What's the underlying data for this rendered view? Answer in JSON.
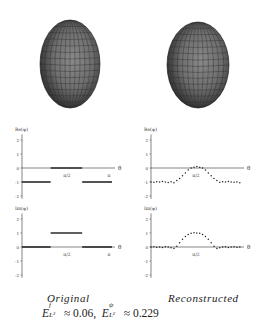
{
  "figure": {
    "captions": {
      "left": "Original",
      "right": "Reconstructed"
    },
    "formula": {
      "term1_symbol": "E",
      "term1_sup": "f",
      "term1_sub": "L²",
      "term1_value": "≈ 0.06,",
      "term2_symbol": "E",
      "term2_sup": "ψ",
      "term2_sub": "L²",
      "term2_value": "≈ 0.229"
    },
    "spheroids": [
      {
        "name": "original-spheroid",
        "cx": 70,
        "cy": 64,
        "rx": 30,
        "ry": 44
      },
      {
        "name": "reconstructed-spheroid",
        "cx": 198,
        "cy": 65,
        "rx": 31,
        "ry": 43
      }
    ]
  },
  "chart_data": [
    {
      "type": "line",
      "title": "Re(ψ) Original",
      "ylabel": "Re(ψ)",
      "xlabel": "θ",
      "x_ticks": [
        "π/2",
        "π"
      ],
      "y_ticks": [
        "2",
        "1",
        "0",
        "-1",
        "-2"
      ],
      "ylim": [
        -2,
        2
      ],
      "xlim": [
        0,
        3.1416
      ],
      "segments": [
        {
          "x": [
            0,
            1.0
          ],
          "y": [
            -1,
            -1
          ]
        },
        {
          "x": [
            1.0,
            2.1
          ],
          "y": [
            0,
            0
          ]
        },
        {
          "x": [
            2.1,
            3.1416
          ],
          "y": [
            -1,
            -1
          ]
        }
      ]
    },
    {
      "type": "scatter",
      "title": "Re(ψ) Reconstructed",
      "ylabel": "Re(ψ)",
      "xlabel": "θ",
      "x_ticks": [
        "π/2"
      ],
      "y_ticks": [
        "2",
        "1",
        "0",
        "-1",
        "-2"
      ],
      "ylim": [
        -2,
        2
      ],
      "x": [
        0.0,
        0.1,
        0.2,
        0.3,
        0.4,
        0.5,
        0.6,
        0.7,
        0.8,
        0.9,
        1.0,
        1.1,
        1.2,
        1.3,
        1.4,
        1.5,
        1.6,
        1.7,
        1.8,
        1.9,
        2.0,
        2.1,
        2.2,
        2.3,
        2.4,
        2.5,
        2.6,
        2.7,
        2.8,
        2.9,
        3.0,
        3.1
      ],
      "values": [
        -1.0,
        -1.02,
        -0.98,
        -1.0,
        -0.97,
        -1.0,
        -1.03,
        -0.98,
        -1.05,
        -0.9,
        -0.75,
        -0.55,
        -0.35,
        -0.15,
        0.0,
        0.05,
        0.1,
        0.05,
        0.0,
        -0.15,
        -0.35,
        -0.55,
        -0.75,
        -0.9,
        -1.02,
        -0.98,
        -1.0,
        -0.97,
        -1.0,
        -1.02,
        -1.0,
        -1.05
      ]
    },
    {
      "type": "line",
      "title": "Im(ψ) Original",
      "ylabel": "Im(ψ)",
      "xlabel": "θ",
      "x_ticks": [
        "π/2",
        "π"
      ],
      "y_ticks": [
        "2",
        "1",
        "0",
        "-1",
        "-2"
      ],
      "ylim": [
        -2,
        2
      ],
      "xlim": [
        0,
        3.1416
      ],
      "segments": [
        {
          "x": [
            0,
            1.0
          ],
          "y": [
            0,
            0
          ]
        },
        {
          "x": [
            1.0,
            2.1
          ],
          "y": [
            1,
            1
          ]
        },
        {
          "x": [
            2.1,
            3.1416
          ],
          "y": [
            0,
            0
          ]
        }
      ]
    },
    {
      "type": "scatter",
      "title": "Im(ψ) Reconstructed",
      "ylabel": "Im(ψ)",
      "xlabel": "θ",
      "x_ticks": [
        "π/2"
      ],
      "y_ticks": [
        "2",
        "1",
        "0",
        "-1",
        "-2"
      ],
      "ylim": [
        -2,
        2
      ],
      "x": [
        0.0,
        0.1,
        0.2,
        0.3,
        0.4,
        0.5,
        0.6,
        0.7,
        0.8,
        0.9,
        1.0,
        1.1,
        1.2,
        1.3,
        1.4,
        1.5,
        1.6,
        1.7,
        1.8,
        1.9,
        2.0,
        2.1,
        2.2,
        2.3,
        2.4,
        2.5,
        2.6,
        2.7,
        2.8,
        2.9,
        3.0,
        3.1
      ],
      "values": [
        0.0,
        0.02,
        -0.02,
        0.0,
        -0.03,
        0.02,
        0.0,
        -0.05,
        -0.1,
        0.05,
        0.3,
        0.55,
        0.75,
        0.9,
        0.98,
        1.02,
        1.0,
        0.98,
        0.9,
        0.75,
        0.55,
        0.3,
        0.05,
        -0.1,
        -0.05,
        0.0,
        0.02,
        -0.03,
        0.0,
        0.02,
        -0.02,
        0.0
      ]
    }
  ]
}
